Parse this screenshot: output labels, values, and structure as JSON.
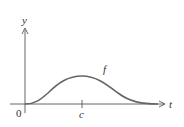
{
  "diagram": {
    "type": "function-graph",
    "axes": {
      "x_label": "t",
      "y_label": "y",
      "origin_label": "0"
    },
    "curve": {
      "label": "f",
      "shape": "bell-shaped curve rising from origin to a maximum at t = c then decaying toward zero"
    },
    "ticks": [
      {
        "label": "c",
        "position": "x-value of curve maximum"
      }
    ],
    "colors": {
      "axes": "#555555",
      "curve": "#666666",
      "text": "#333333"
    }
  }
}
